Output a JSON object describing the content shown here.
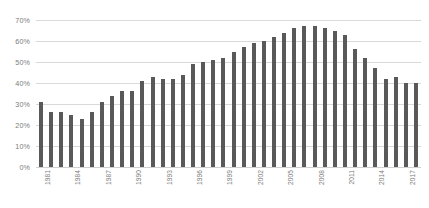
{
  "chart_data": {
    "type": "bar",
    "title": "",
    "xlabel": "",
    "ylabel": "",
    "ylim": [
      0,
      70
    ],
    "ytick_labels": [
      "70%",
      "60%",
      "50%",
      "40%",
      "30%",
      "20%",
      "10%",
      "0%"
    ],
    "ytick_values": [
      70,
      60,
      50,
      40,
      30,
      20,
      10,
      0
    ],
    "grid": true,
    "legend": "none",
    "bar_color": "#595959",
    "grid_color": "#d9d9d9",
    "axis_text_color": "#7b7b7b",
    "xtick_interval": 3,
    "categories": [
      "1981",
      "1982",
      "1983",
      "1984",
      "1985",
      "1986",
      "1987",
      "1988",
      "1989",
      "1990",
      "1991",
      "1992",
      "1993",
      "1994",
      "1995",
      "1996",
      "1997",
      "1998",
      "1999",
      "2000",
      "2001",
      "2002",
      "2003",
      "2004",
      "2005",
      "2006",
      "2007",
      "2008",
      "2009",
      "2010",
      "2011",
      "2012",
      "2013",
      "2014",
      "2015",
      "2016",
      "2017",
      "2018"
    ],
    "values": [
      31,
      26,
      26,
      25,
      23,
      26,
      31,
      34,
      36,
      36,
      41,
      43,
      42,
      42,
      44,
      49,
      50,
      51,
      52,
      55,
      57,
      59,
      60,
      62,
      64,
      66,
      67,
      67,
      66,
      65,
      63,
      56,
      52,
      47,
      42,
      43,
      40,
      40
    ],
    "xtick_labels_shown": [
      "1981",
      "1984",
      "1987",
      "1990",
      "1993",
      "1996",
      "1999",
      "2002",
      "2005",
      "2008",
      "2011",
      "2014",
      "2017"
    ]
  }
}
